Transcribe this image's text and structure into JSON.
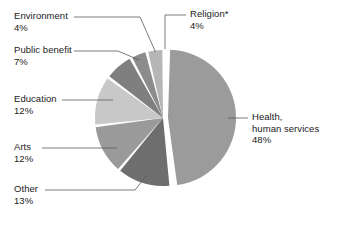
{
  "chart_data": {
    "type": "pie",
    "title": "",
    "subtitle": "",
    "xlabel": "",
    "ylabel": "",
    "legend_position": "none",
    "grid": false,
    "value_unit": "percent",
    "categories": [
      "Health, human services",
      "Religion*",
      "Environment",
      "Public benefit",
      "Education",
      "Arts",
      "Other"
    ],
    "values": [
      48,
      4,
      4,
      7,
      12,
      12,
      13
    ],
    "slice_colors": [
      "#9b9b9b",
      "#b6b6b6",
      "#8c8c8c",
      "#7f7f7f",
      "#c8c8c8",
      "#9a9a9a",
      "#6e6e6e"
    ],
    "exploded_slice": "Health, human services",
    "annotations": [
      "* Religion slice marked with asterisk footnote"
    ]
  },
  "labels": {
    "environment": {
      "category": "Environment",
      "percent": "4%"
    },
    "public_benefit": {
      "category": "Public benefit",
      "percent": "7%"
    },
    "education": {
      "category": "Education",
      "percent": "12%"
    },
    "arts": {
      "category": "Arts",
      "percent": "12%"
    },
    "other": {
      "category": "Other",
      "percent": "13%"
    },
    "religion": {
      "category": "Religion*",
      "percent": "4%"
    },
    "health": {
      "category_line1": "Health,",
      "category_line2": "human services",
      "percent": "48%"
    }
  }
}
